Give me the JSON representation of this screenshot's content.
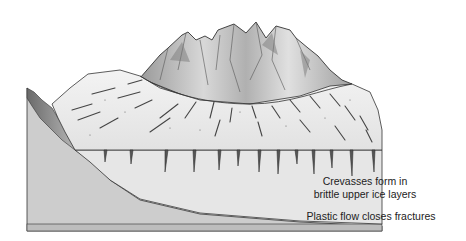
{
  "diagram": {
    "labels": {
      "crevasses_line1": "Crevasses form in",
      "crevasses_line2": "brittle upper ice layers",
      "plastic_flow": "Plastic flow closes fractures"
    },
    "colors": {
      "ice_surface": "#ececec",
      "ice_front": "#e4e4e4",
      "bedrock": "#c8c8c8",
      "mountain_light": "#e6e6e6",
      "mountain_dark": "#8a8a8a",
      "outline": "#333333",
      "base_strip": "#bdbdbd"
    }
  }
}
